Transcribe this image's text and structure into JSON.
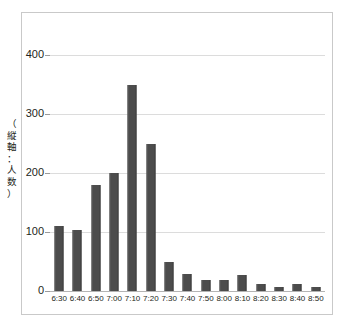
{
  "chart_data": {
    "type": "bar",
    "title": "",
    "subtitle": "",
    "xlabel": "",
    "ylabel": "（縦軸：人数）",
    "ylim": [
      0,
      430
    ],
    "ytick_values": [
      0,
      100,
      200,
      300,
      400
    ],
    "ytick_labels": [
      "0",
      "100",
      "200",
      "300",
      "400"
    ],
    "grid": true,
    "legend": null,
    "bar_color": "#4c4c4c",
    "gridline_color": "#dcdcdc",
    "axis_color": "#b4b4b4",
    "frame_color": "#c9c9c9",
    "categories": [
      "6:30",
      "6:40",
      "6:50",
      "7:00",
      "7:10",
      "7:20",
      "7:30",
      "7:40",
      "7:50",
      "8:00",
      "8:10",
      "8:20",
      "8:30",
      "8:40",
      "8:50"
    ],
    "values": [
      110,
      103,
      180,
      200,
      350,
      250,
      50,
      28,
      18,
      18,
      27,
      12,
      6,
      12,
      7
    ]
  }
}
